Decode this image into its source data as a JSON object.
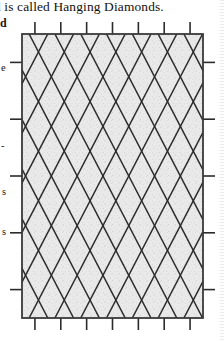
{
  "page": {
    "background_color": "#ffffff",
    "text_color": "#15120f"
  },
  "caption": {
    "text": "d is called Hanging Diamonds."
  },
  "margin_fragments": [
    {
      "text": "d"
    },
    {
      "text": "e"
    },
    {
      "text": "-"
    },
    {
      "text": "s"
    },
    {
      "text": "s"
    }
  ],
  "figure": {
    "title": "Hanging Diamonds",
    "fill_color": "#e7e7e7",
    "line_color": "#2b2b2b",
    "border_color": "#3a3a3a",
    "frame": {
      "x": 22,
      "y": 20,
      "width": 181,
      "height": 284
    },
    "ticks": {
      "top_count": 7,
      "bottom_count": 7,
      "left_count": 5,
      "right_count": 5,
      "length": 12
    },
    "lattice": {
      "description": "two crossing families of steep diagonal lines forming a diamond lattice",
      "down_right_count": 13,
      "down_left_count": 13,
      "spacing": 25.8,
      "slope_run": 12.9
    }
  }
}
